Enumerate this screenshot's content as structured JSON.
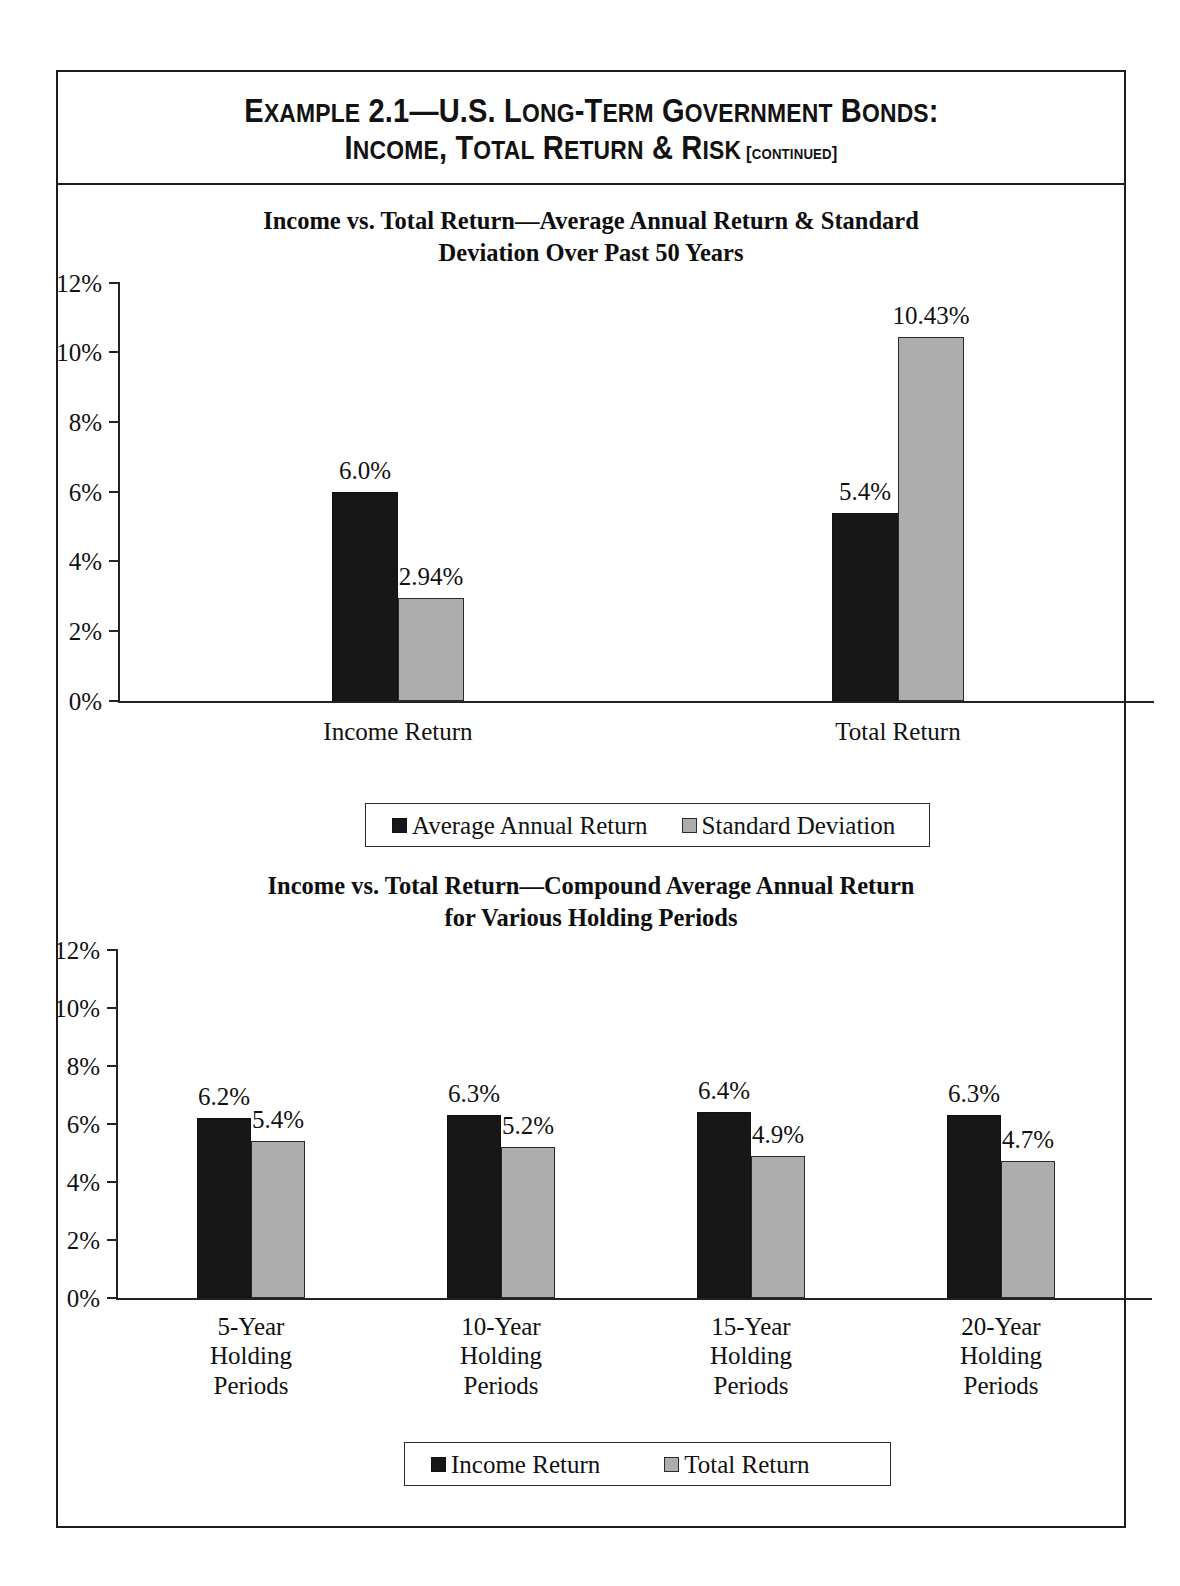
{
  "exhibit": {
    "title_line_1_a": "E",
    "title_line_1_b": "XAMPLE",
    "title_line_1_c": " 2.1—U.S. L",
    "title_line_1_d": "ONG",
    "title_line_1_e": "-T",
    "title_line_1_f": "ERM",
    "title_line_1_g": " G",
    "title_line_1_h": "OVERNMENT",
    "title_line_1_i": " B",
    "title_line_1_j": "ONDS",
    "title_line_1_k": ":",
    "title_line_2_a": "I",
    "title_line_2_b": "NCOME",
    "title_line_2_c": ", T",
    "title_line_2_d": "OTAL",
    "title_line_2_e": " R",
    "title_line_2_f": "ETURN",
    "title_line_2_g": " & R",
    "title_line_2_h": "ISK",
    "title_line_2_i": " [",
    "title_line_2_j": "CONTINUED",
    "title_line_2_k": "]",
    "title_plain_line_1": "EXAMPLE 2.1—U.S. LONG-TERM GOVERNMENT BONDS:",
    "title_plain_line_2": "INCOME, TOTAL RETURN & RISK [CONTINUED]"
  },
  "colors": {
    "series_dark": "#171717",
    "series_light": "#adadad",
    "axis": "#232323",
    "frame": "#1d1d1d",
    "text": "#111111"
  },
  "chart_data": [
    {
      "id": "chart-1",
      "type": "bar",
      "title": "Income vs. Total Return—Average Annual Return & Standard Deviation Over Past 50 Years",
      "title_line_1": "Income vs. Total Return—Average Annual Return & Standard",
      "title_line_2": "Deviation Over Past 50 Years",
      "xlabel": "",
      "ylabel": "",
      "ylim": [
        0,
        12
      ],
      "ytick_values": [
        0,
        2,
        4,
        6,
        8,
        10,
        12
      ],
      "ytick_labels": [
        "0%",
        "2%",
        "4%",
        "6%",
        "8%",
        "10%",
        "12%"
      ],
      "grid": false,
      "legend_position": "bottom",
      "categories": [
        "Income Return",
        "Total Return"
      ],
      "series": [
        {
          "name": "Average Annual Return",
          "color": "#171717",
          "values": [
            6.0,
            5.4
          ],
          "labels": [
            "6.0%",
            "5.4%"
          ]
        },
        {
          "name": "Standard Deviation",
          "color": "#adadad",
          "values": [
            2.94,
            10.43
          ],
          "labels": [
            "2.94%",
            "10.43%"
          ]
        }
      ]
    },
    {
      "id": "chart-2",
      "type": "bar",
      "title": "Income vs. Total Return—Compound Average Annual Return for Various Holding Periods",
      "title_line_1": "Income vs. Total Return—Compound Average Annual Return",
      "title_line_2": "for Various Holding Periods",
      "xlabel": "",
      "ylabel": "",
      "ylim": [
        0,
        12
      ],
      "ytick_values": [
        0,
        2,
        4,
        6,
        8,
        10,
        12
      ],
      "ytick_labels": [
        "0%",
        "2%",
        "4%",
        "6%",
        "8%",
        "10%",
        "12%"
      ],
      "grid": false,
      "legend_position": "bottom",
      "categories": [
        "5-Year\nHolding\nPeriods",
        "10-Year\nHolding\nPeriods",
        "15-Year\nHolding\nPeriods",
        "20-Year\nHolding\nPeriods"
      ],
      "series": [
        {
          "name": "Income Return",
          "color": "#171717",
          "values": [
            6.2,
            6.3,
            6.4,
            6.3
          ],
          "labels": [
            "6.2%",
            "6.3%",
            "6.4%",
            "6.3%"
          ]
        },
        {
          "name": "Total Return",
          "color": "#adadad",
          "values": [
            5.4,
            5.2,
            4.9,
            4.7
          ],
          "labels": [
            "5.4%",
            "5.2%",
            "4.9%",
            "4.7%"
          ]
        }
      ]
    }
  ]
}
